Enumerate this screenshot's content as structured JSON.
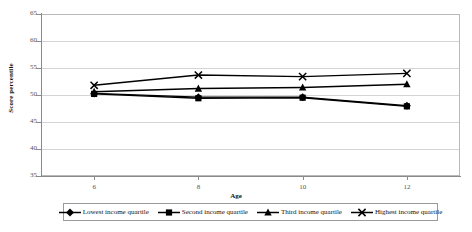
{
  "chart_data": {
    "type": "line",
    "title": "",
    "xlabel": "Age",
    "ylabel": "Score percentile",
    "x": [
      6,
      8,
      10,
      12
    ],
    "xtick_labels": [
      "6",
      "8",
      "10",
      "12"
    ],
    "xlim": [
      5,
      13
    ],
    "ylim": [
      35,
      65
    ],
    "ytick_labels": [
      "65",
      "60",
      "55",
      "50",
      "45",
      "40",
      "35"
    ],
    "yticks": [
      65,
      60,
      55,
      50,
      45,
      40,
      35
    ],
    "grid": true,
    "legend_position": "bottom",
    "series": [
      {
        "name": "Lowest income quartile",
        "marker": "diamond",
        "values": [
          50.3,
          49.6,
          49.6,
          48.0
        ]
      },
      {
        "name": "Second income quartile",
        "marker": "square",
        "values": [
          50.2,
          49.4,
          49.5,
          47.9
        ]
      },
      {
        "name": "Third income quartile",
        "marker": "triangle",
        "values": [
          50.6,
          51.2,
          51.4,
          52.0
        ]
      },
      {
        "name": "Highest income quartile",
        "marker": "cross",
        "values": [
          51.8,
          53.7,
          53.4,
          54.0
        ]
      }
    ]
  },
  "legend": {
    "items": [
      {
        "label": "Lowest income quartile"
      },
      {
        "label": "Second income quartile"
      },
      {
        "label": "Third income quartile"
      },
      {
        "label": "Highest income quartile"
      }
    ]
  },
  "colors": {
    "line": "#000000",
    "grid": "#d4d4d4",
    "axis": "#8a8a8a",
    "text": "#111111"
  }
}
